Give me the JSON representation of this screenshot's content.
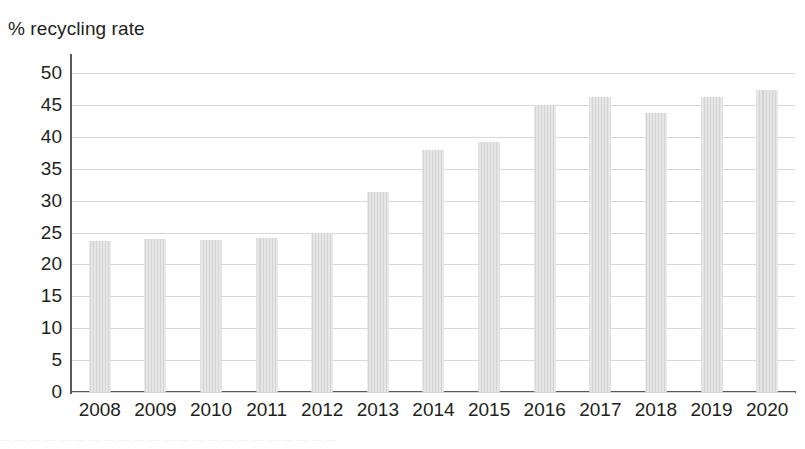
{
  "chart_data": {
    "type": "bar",
    "title": "% recycling rate",
    "xlabel": "",
    "ylabel": "% recycling rate",
    "categories": [
      "2008",
      "2009",
      "2010",
      "2011",
      "2012",
      "2013",
      "2014",
      "2015",
      "2016",
      "2017",
      "2018",
      "2019",
      "2020"
    ],
    "values": [
      23.7,
      24.0,
      23.9,
      24.1,
      25.0,
      31.4,
      38.0,
      39.2,
      45.0,
      46.3,
      43.7,
      46.3,
      47.4
    ],
    "ylim": [
      0,
      50
    ],
    "ytick_labels": [
      "50",
      "45",
      "40",
      "35",
      "30",
      "25",
      "20",
      "15",
      "10",
      "5",
      "0"
    ],
    "ytick_values": [
      50,
      45,
      40,
      35,
      30,
      25,
      20,
      15,
      10,
      5,
      0
    ],
    "ytick_step": 5,
    "grid": "horizontal",
    "legend": "none",
    "bar_color": "#dedede",
    "grid_color": "#d7d8da",
    "axis_color": "#58595b",
    "text_color": "#231f20"
  },
  "page": {
    "bottom_fragment": "— — —  — — — — —   — —  — — —   — — — —   — —  — — — —"
  }
}
